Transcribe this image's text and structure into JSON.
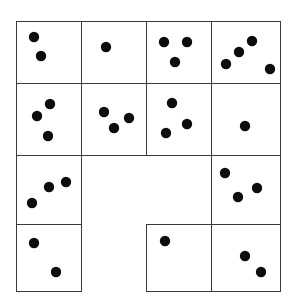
{
  "figure": {
    "title": "",
    "canvas": {
      "width": 292,
      "height": 308,
      "background": "#ffffff"
    },
    "style": {
      "cell_stroke": "#3a3a3a",
      "cell_stroke_width": 1,
      "cell_fill": "#ffffff",
      "dot_color": "#0d0d0d",
      "dot_radius": 5.2
    },
    "cells": [
      {
        "id": "cell-r1c1",
        "label": "row-1-col-1",
        "x": 16,
        "y": 21,
        "w": 65,
        "h": 62,
        "dot_count": 2,
        "dots": [
          [
            34,
            37
          ],
          [
            41,
            56
          ]
        ]
      },
      {
        "id": "cell-r1c2",
        "label": "row-1-col-2",
        "x": 81,
        "y": 21,
        "w": 65,
        "h": 62,
        "dot_count": 1,
        "dots": [
          [
            106,
            47
          ]
        ]
      },
      {
        "id": "cell-r1c3",
        "label": "row-1-col-3",
        "x": 146,
        "y": 21,
        "w": 65,
        "h": 62,
        "dot_count": 3,
        "dots": [
          [
            164,
            42
          ],
          [
            187,
            42
          ],
          [
            175,
            62
          ]
        ]
      },
      {
        "id": "cell-r1c4",
        "label": "row-1-col-4",
        "x": 211,
        "y": 21,
        "w": 69,
        "h": 62,
        "dot_count": 4,
        "dots": [
          [
            252,
            41
          ],
          [
            239,
            52
          ],
          [
            226,
            64
          ],
          [
            270,
            69
          ]
        ]
      },
      {
        "id": "cell-r2c1",
        "label": "row-2-col-1",
        "x": 16,
        "y": 83,
        "w": 65,
        "h": 72,
        "dot_count": 3,
        "dots": [
          [
            50,
            104
          ],
          [
            37,
            116
          ],
          [
            48,
            136
          ]
        ]
      },
      {
        "id": "cell-r2c2",
        "label": "row-2-col-2",
        "x": 81,
        "y": 83,
        "w": 65,
        "h": 72,
        "dot_count": 3,
        "dots": [
          [
            104,
            112
          ],
          [
            129,
            118
          ],
          [
            114,
            128
          ]
        ]
      },
      {
        "id": "cell-r2c3",
        "label": "row-2-col-3",
        "x": 146,
        "y": 83,
        "w": 65,
        "h": 72,
        "dot_count": 3,
        "dots": [
          [
            172,
            103
          ],
          [
            187,
            124
          ],
          [
            166,
            133
          ]
        ]
      },
      {
        "id": "cell-r2c4",
        "label": "row-2-col-4",
        "x": 211,
        "y": 83,
        "w": 69,
        "h": 72,
        "dot_count": 1,
        "dots": [
          [
            245,
            126
          ]
        ]
      },
      {
        "id": "cell-r3c1",
        "label": "row-3-col-1",
        "x": 16,
        "y": 155,
        "w": 65,
        "h": 69,
        "dot_count": 3,
        "dots": [
          [
            49,
            187
          ],
          [
            66,
            182
          ],
          [
            32,
            203
          ]
        ]
      },
      {
        "id": "cell-r3c4",
        "label": "row-3-col-4",
        "x": 211,
        "y": 155,
        "w": 69,
        "h": 69,
        "dot_count": 3,
        "dots": [
          [
            225,
            173
          ],
          [
            257,
            188
          ],
          [
            238,
            197
          ]
        ]
      },
      {
        "id": "cell-r4c1",
        "label": "row-4-col-1",
        "x": 16,
        "y": 224,
        "w": 65,
        "h": 67,
        "dot_count": 2,
        "dots": [
          [
            34,
            243
          ],
          [
            56,
            272
          ]
        ]
      },
      {
        "id": "cell-r4c3",
        "label": "row-4-col-3",
        "x": 146,
        "y": 224,
        "w": 65,
        "h": 67,
        "dot_count": 1,
        "dots": [
          [
            165,
            241
          ]
        ]
      },
      {
        "id": "cell-r4c4",
        "label": "row-4-col-4",
        "x": 211,
        "y": 224,
        "w": 69,
        "h": 67,
        "dot_count": 2,
        "dots": [
          [
            245,
            256
          ],
          [
            261,
            272
          ]
        ]
      }
    ]
  }
}
